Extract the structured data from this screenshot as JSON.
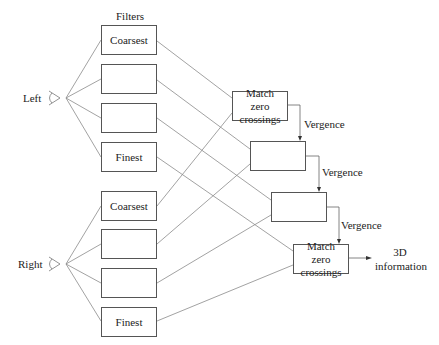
{
  "title": "Filters",
  "eyes": {
    "left": {
      "label": "Left"
    },
    "right": {
      "label": "Right"
    }
  },
  "filters": {
    "left": [
      "Coarsest",
      "",
      "",
      "Finest"
    ],
    "right": [
      "Coarsest",
      "",
      "",
      "Finest"
    ]
  },
  "matchers": [
    "Match zero crossings",
    "",
    "",
    "Match zero crossings"
  ],
  "vergence_labels": [
    "Vergence",
    "Vergence",
    "Vergence"
  ],
  "output": {
    "line1": "3D",
    "line2": "information"
  },
  "colors": {
    "line": "#777777",
    "box_border": "#555555",
    "text": "#222222"
  }
}
